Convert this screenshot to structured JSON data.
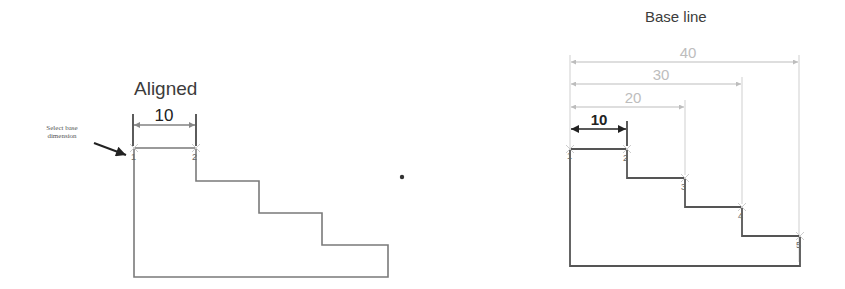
{
  "left_panel": {
    "title": "Aligned",
    "annotation_line1": "Select base",
    "annotation_line2": "dimension",
    "dimension_value": "10",
    "points": [
      "1",
      "2"
    ]
  },
  "right_panel": {
    "title": "Base line",
    "dimensions": [
      {
        "value": "10",
        "style": "dark"
      },
      {
        "value": "20",
        "style": "light"
      },
      {
        "value": "30",
        "style": "light"
      },
      {
        "value": "40",
        "style": "light"
      }
    ],
    "points": [
      "1",
      "2",
      "3",
      "4",
      "5"
    ]
  },
  "colors": {
    "outline": "#6e6e6e",
    "dark_dim": "#222222",
    "light_dim": "#bdbdbd",
    "title": "#3c3c3c"
  }
}
